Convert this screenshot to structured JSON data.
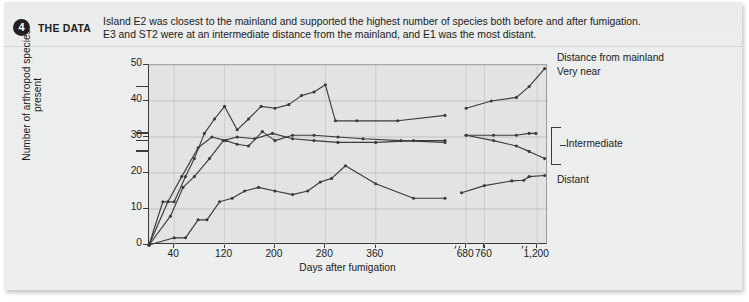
{
  "header": {
    "number": "4",
    "kicker": "THE DATA",
    "caption_line1": "Island E2 was closest to the mainland and supported the highest number of species both before and after fumigation.",
    "caption_line2": "E3 and ST2 were at an intermediate distance from the mainland, and E1 was the most distant."
  },
  "annotations": {
    "predefaunation": "Predefaunation surveys",
    "distance_title": "Distance from mainland",
    "very_near": "Very near",
    "intermediate": "Intermediate",
    "distant": "Distant"
  },
  "series_labels": {
    "e2": "E2",
    "e3": "E3",
    "st2": "ST2",
    "e1": "E1"
  },
  "chart_data": {
    "type": "line",
    "title": "",
    "xlabel": "Days after fumigation",
    "ylabel": "Number of arthropod species present",
    "ylim": [
      0,
      50
    ],
    "yticks": [
      0,
      10,
      20,
      30,
      40,
      50
    ],
    "xticks": [
      40,
      120,
      200,
      280,
      360,
      680,
      760,
      1200
    ],
    "xtick_labels": [
      "40",
      "120",
      "200",
      "280",
      "360",
      "680",
      "760",
      "1,200"
    ],
    "axis_breaks": [
      640,
      1000
    ],
    "grid": true,
    "legend": "right-annotations",
    "predefaunation_values": {
      "E2": 44,
      "E3": 31,
      "ST2": 29,
      "E1": 26
    },
    "series": [
      {
        "name": "E2",
        "distance": "Very near",
        "points": [
          [
            0,
            0
          ],
          [
            22,
            12
          ],
          [
            40,
            12
          ],
          [
            58,
            19
          ],
          [
            72,
            24
          ],
          [
            88,
            31
          ],
          [
            104,
            35
          ],
          [
            120,
            38.5
          ],
          [
            140,
            32
          ],
          [
            158,
            35
          ],
          [
            178,
            38.5
          ],
          [
            200,
            38
          ],
          [
            222,
            39
          ],
          [
            242,
            41.5
          ],
          [
            262,
            42.5
          ],
          [
            280,
            44.5
          ],
          [
            296,
            34.5
          ],
          [
            330,
            34.5
          ],
          [
            395,
            34.5
          ],
          [
            470,
            36
          ]
        ],
        "points_after_break": [
          [
            680,
            38
          ],
          [
            790,
            40
          ],
          [
            900,
            41
          ],
          [
            1080,
            44
          ],
          [
            1310,
            49
          ]
        ]
      },
      {
        "name": "E3",
        "distance": "Intermediate",
        "points": [
          [
            0,
            0
          ],
          [
            30,
            12
          ],
          [
            52,
            19
          ],
          [
            78,
            27
          ],
          [
            100,
            30
          ],
          [
            122,
            29
          ],
          [
            140,
            28
          ],
          [
            158,
            27.5
          ],
          [
            180,
            31.5
          ],
          [
            200,
            29
          ],
          [
            228,
            30.5
          ],
          [
            262,
            30.5
          ],
          [
            300,
            30
          ],
          [
            340,
            29.5
          ],
          [
            400,
            29
          ],
          [
            470,
            28.5
          ]
        ],
        "points_after_break": [
          [
            680,
            30.5
          ],
          [
            800,
            30.5
          ],
          [
            900,
            30.5
          ],
          [
            1080,
            31
          ],
          [
            1180,
            31
          ]
        ]
      },
      {
        "name": "ST2",
        "distance": "Intermediate",
        "points": [
          [
            0,
            0
          ],
          [
            34,
            8
          ],
          [
            54,
            16
          ],
          [
            72,
            19
          ],
          [
            96,
            24
          ],
          [
            118,
            29
          ],
          [
            140,
            30
          ],
          [
            168,
            29.5
          ],
          [
            196,
            31
          ],
          [
            228,
            29.5
          ],
          [
            262,
            29
          ],
          [
            300,
            28.5
          ],
          [
            360,
            28.5
          ],
          [
            420,
            29
          ],
          [
            470,
            29
          ]
        ],
        "points_after_break": [
          [
            680,
            30.5
          ],
          [
            800,
            29
          ],
          [
            900,
            27.5
          ],
          [
            1080,
            26
          ],
          [
            1310,
            24
          ]
        ]
      },
      {
        "name": "E1",
        "distance": "Distant",
        "points": [
          [
            0,
            0
          ],
          [
            40,
            2
          ],
          [
            58,
            2
          ],
          [
            78,
            7
          ],
          [
            92,
            7
          ],
          [
            112,
            12
          ],
          [
            132,
            13
          ],
          [
            152,
            15
          ],
          [
            174,
            16
          ],
          [
            200,
            15
          ],
          [
            228,
            14
          ],
          [
            252,
            15
          ],
          [
            272,
            17.5
          ],
          [
            290,
            18.5
          ],
          [
            312,
            22
          ],
          [
            360,
            17
          ],
          [
            420,
            13
          ],
          [
            470,
            13
          ]
        ],
        "points_after_break": [
          [
            660,
            14.5
          ],
          [
            760,
            16.5
          ],
          [
            880,
            17.8
          ],
          [
            1000,
            18
          ],
          [
            1080,
            19
          ],
          [
            1310,
            19.3
          ]
        ]
      }
    ]
  }
}
